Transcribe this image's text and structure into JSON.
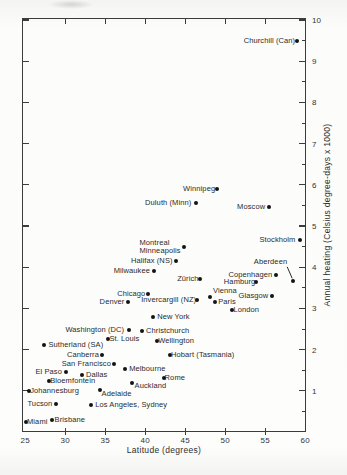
{
  "chart_data": {
    "type": "scatter",
    "title": "",
    "xlabel": "Latitude  (degrees)",
    "ylabel": "Annual heating  (Celsius degree-days x 1000)",
    "xlim": [
      24.6,
      60.1
    ],
    "ylim": [
      0,
      10.05
    ],
    "x_ticks": [
      25,
      30,
      35,
      40,
      45,
      50,
      55,
      60
    ],
    "y_ticks": [
      1,
      2,
      3,
      4,
      5,
      6,
      7,
      8,
      9,
      10
    ],
    "y_minor_tick_step": 0.5,
    "grid": false,
    "y_axis_labels_position": "right",
    "marker": "filled-circle",
    "points": [
      {
        "label": "Churchill (Can)",
        "lat": 59.0,
        "heating": 9.5,
        "side": "left",
        "gap": 2
      },
      {
        "label": "Winnipeg",
        "lat": 49.0,
        "heating": 5.9,
        "side": "left",
        "gap": 2
      },
      {
        "label": "Duluth (Minn)",
        "lat": 46.4,
        "heating": 5.55,
        "side": "left",
        "gap": 5
      },
      {
        "label": "Moscow",
        "lat": 55.5,
        "heating": 5.45,
        "side": "left",
        "gap": 4
      },
      {
        "label": "Stockholm",
        "lat": 59.4,
        "heating": 4.65,
        "side": "left",
        "gap": 5
      },
      {
        "label": "Montreal Minneapolis",
        "lines": [
          "Montreal",
          "Minneapolis"
        ],
        "lat": 44.8,
        "heating": 4.5,
        "side": "left",
        "gap": 3
      },
      {
        "label": "Halifax (NS)",
        "lat": 43.8,
        "heating": 4.15,
        "side": "left",
        "gap": 3
      },
      {
        "label": "Milwaukee",
        "lat": 41.1,
        "heating": 3.9,
        "side": "left",
        "gap": 4
      },
      {
        "label": "Aberdeen",
        "lat": 58.5,
        "heating": 3.67,
        "side": "left",
        "gap": 4,
        "dx": -2,
        "dy": -19,
        "connector": true
      },
      {
        "label": "Copenhagen",
        "lat": 56.4,
        "heating": 3.8,
        "side": "left",
        "gap": 4
      },
      {
        "label": "Hamburg",
        "lat": 53.9,
        "heating": 3.65,
        "side": "left",
        "gap": 1
      },
      {
        "label": "Zürich",
        "lat": 46.8,
        "heating": 3.72,
        "side": "left",
        "gap": 1
      },
      {
        "label": "Chicago",
        "lat": 40.4,
        "heating": 3.35,
        "side": "left",
        "gap": 3
      },
      {
        "label": "Vienna",
        "lat": 48.1,
        "heating": 3.27,
        "side": "right",
        "gap": 3,
        "dy": -6
      },
      {
        "label": "Glasgow",
        "lat": 55.9,
        "heating": 3.29,
        "side": "left",
        "gap": 4
      },
      {
        "label": "Denver",
        "lat": 37.9,
        "heating": 3.16,
        "side": "left",
        "gap": 4
      },
      {
        "label": "Invercargill (NZ)",
        "lat": 46.5,
        "heating": 3.21,
        "side": "left",
        "gap": 1
      },
      {
        "label": "Paris",
        "lat": 48.75,
        "heating": 3.16,
        "side": "right",
        "gap": 3
      },
      {
        "label": "London",
        "lat": 50.9,
        "heating": 2.96,
        "side": "right",
        "gap": 1
      },
      {
        "label": "New York",
        "lat": 41.0,
        "heating": 2.8,
        "side": "right",
        "gap": 4
      },
      {
        "label": "Washington (DC)",
        "lat": 38.0,
        "heating": 2.48,
        "side": "left",
        "gap": 5
      },
      {
        "label": "Christchurch",
        "lat": 39.6,
        "heating": 2.45,
        "side": "right",
        "gap": 4
      },
      {
        "label": "St. Louis",
        "lat": 35.4,
        "heating": 2.26,
        "side": "right",
        "gap": 1
      },
      {
        "label": "Wellington",
        "lat": 41.5,
        "heating": 2.21,
        "side": "right",
        "gap": 1
      },
      {
        "label": "Sutherland (SA)",
        "lat": 27.4,
        "heating": 2.11,
        "side": "right",
        "gap": 4
      },
      {
        "label": "Canberra",
        "lat": 34.6,
        "heating": 1.87,
        "side": "left",
        "gap": 3
      },
      {
        "label": "Hobart (Tasmania)",
        "lat": 43.1,
        "heating": 1.86,
        "side": "right",
        "gap": 1
      },
      {
        "label": "San Francisco",
        "lat": 36.1,
        "heating": 1.65,
        "side": "left",
        "gap": 3
      },
      {
        "label": "El Paso",
        "lat": 30.1,
        "heating": 1.46,
        "side": "left",
        "gap": 4
      },
      {
        "label": "Dallas",
        "lat": 32.1,
        "heating": 1.39,
        "side": "right",
        "gap": 4
      },
      {
        "label": "Melbourne",
        "lat": 37.5,
        "heating": 1.53,
        "side": "right",
        "gap": 4
      },
      {
        "label": "Bloemfontein",
        "lat": 28.0,
        "heating": 1.24,
        "side": "right",
        "gap": 1
      },
      {
        "label": "Rome",
        "lat": 42.3,
        "heating": 1.31,
        "side": "right",
        "gap": 1
      },
      {
        "label": "Johannesburg",
        "lat": 25.5,
        "heating": 1.0,
        "side": "right",
        "gap": 1
      },
      {
        "label": "Auckland",
        "lat": 38.3,
        "heating": 1.18,
        "side": "right",
        "gap": 3,
        "dy": 3
      },
      {
        "label": "Adelaide",
        "lat": 34.3,
        "heating": 1.01,
        "side": "right",
        "gap": 2,
        "dy": 4
      },
      {
        "label": "Tucson",
        "lat": 28.9,
        "heating": 0.67,
        "side": "left",
        "gap": 4
      },
      {
        "label": "Los Angeles, Sydney",
        "lat": 33.25,
        "heating": 0.65,
        "side": "right",
        "gap": 4
      },
      {
        "label": "Miami",
        "lat": 25.1,
        "heating": 0.24,
        "side": "right",
        "gap": 1
      },
      {
        "label": "Brisbane",
        "lat": 28.3,
        "heating": 0.28,
        "side": "right",
        "gap": 3
      }
    ],
    "colors": {
      "marker": "#141414",
      "axis": "#3c3c3c",
      "text": "#2b2b2b",
      "background": "#fcfcfb"
    }
  }
}
